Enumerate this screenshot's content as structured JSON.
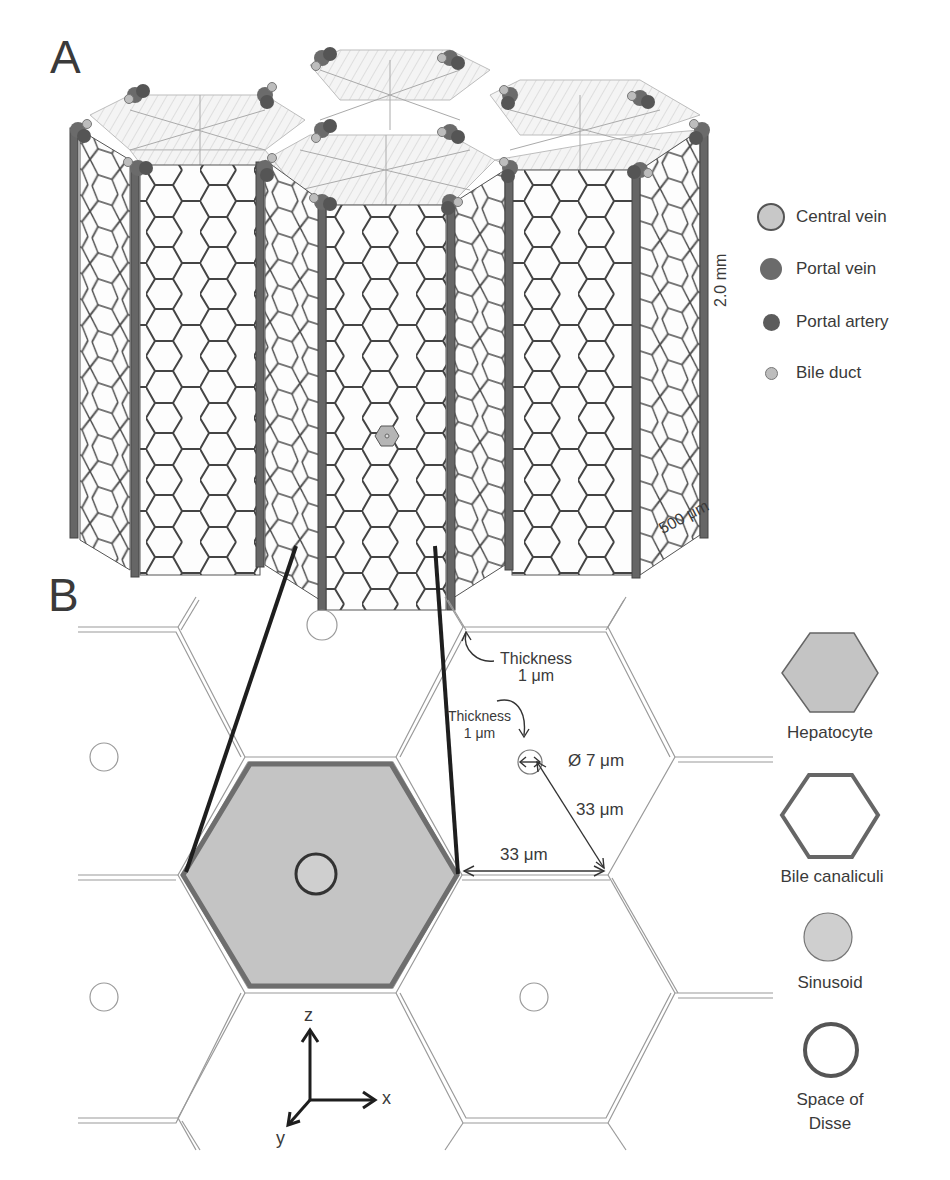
{
  "panels": {
    "a": {
      "label": "A",
      "legend": [
        {
          "name": "Central vein",
          "color": "#c8c8c8",
          "size": 24,
          "border": "#555555"
        },
        {
          "name": "Portal vein",
          "color": "#6b6b6b",
          "size": 22,
          "border": "#5a5a5a"
        },
        {
          "name": "Portal artery",
          "color": "#5c5c5c",
          "size": 17,
          "border": "#4a4a4a"
        },
        {
          "name": "Bile duct",
          "color": "#bdbdbd",
          "size": 11,
          "border": "#777777"
        }
      ],
      "scale_vertical": "2.0 mm",
      "scale_depth": "500 μm"
    },
    "b": {
      "label": "B",
      "annotations": {
        "thickness_wall": {
          "title": "Thickness",
          "value": "1 μm"
        },
        "thickness_disse": {
          "title": "Thickness",
          "value": "1 μm"
        },
        "diameter": "Ø 7 μm",
        "radius_distance": "33 μm",
        "edge_distance": "33 μm"
      },
      "axes": {
        "z": "z",
        "x": "x",
        "y": "y"
      },
      "legend": [
        {
          "name": "Hepatocyte"
        },
        {
          "name": "Bile canaliculi"
        },
        {
          "name": "Sinusoid"
        },
        {
          "name": "Space of Disse",
          "lines": [
            "Space of",
            "Disse"
          ]
        }
      ]
    }
  },
  "colors": {
    "hepatocyte_fill": "#c4c4c4",
    "canaliculi_stroke": "#6e6e6e",
    "dark_line": "#1e1e1e",
    "wall_line": "#9a9a9a",
    "hex_stroke": "#444444"
  }
}
